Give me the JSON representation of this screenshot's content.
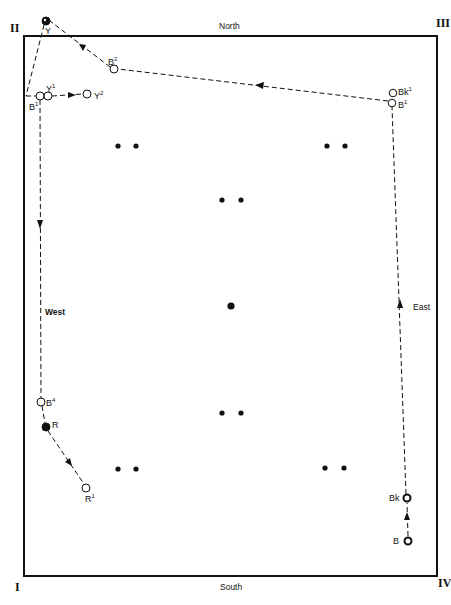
{
  "diagram": {
    "directions": {
      "north": "North",
      "south": "South",
      "west": "West",
      "east": "East"
    },
    "corners": {
      "top_left": "II",
      "top_right": "III",
      "bottom_left": "I",
      "bottom_right": "IV"
    },
    "colors": {
      "ink": "#111111",
      "background": "#ffffff",
      "frame": "#111111"
    },
    "frame": {
      "x": 24,
      "y": 36,
      "width": 413,
      "height": 540
    },
    "fixed_dots": [
      {
        "x": 118,
        "y": 146
      },
      {
        "x": 136,
        "y": 146
      },
      {
        "x": 327,
        "y": 146
      },
      {
        "x": 345,
        "y": 146
      },
      {
        "x": 222,
        "y": 200
      },
      {
        "x": 241,
        "y": 200
      },
      {
        "x": 231,
        "y": 306,
        "large": true
      },
      {
        "x": 222,
        "y": 413
      },
      {
        "x": 241,
        "y": 413
      },
      {
        "x": 118,
        "y": 469
      },
      {
        "x": 136,
        "y": 469
      },
      {
        "x": 325,
        "y": 468
      },
      {
        "x": 344,
        "y": 468
      }
    ],
    "markers": [
      {
        "id": "Y",
        "label": "Y",
        "sup": "",
        "x": 46,
        "y": 21,
        "type": "filled"
      },
      {
        "id": "B2",
        "label": "B",
        "sup": "2",
        "x": 114,
        "y": 69,
        "type": "open"
      },
      {
        "id": "Bk1",
        "label": "Bk",
        "sup": "1",
        "x": 393,
        "y": 93,
        "type": "open"
      },
      {
        "id": "B1e",
        "label": "B",
        "sup": "1",
        "x": 392,
        "y": 103,
        "type": "open"
      },
      {
        "id": "B1w",
        "label": "B",
        "sup": "1",
        "x": 40,
        "y": 96,
        "type": "open"
      },
      {
        "id": "Y1",
        "label": "Y",
        "sup": "1",
        "x": 48,
        "y": 96,
        "type": "open"
      },
      {
        "id": "Y2",
        "label": "Y",
        "sup": "2",
        "x": 87,
        "y": 94,
        "type": "open"
      },
      {
        "id": "B4",
        "label": "B",
        "sup": "4",
        "x": 41,
        "y": 402,
        "type": "open"
      },
      {
        "id": "R",
        "label": "R",
        "sup": "",
        "x": 46,
        "y": 427,
        "type": "filled"
      },
      {
        "id": "R1",
        "label": "R",
        "sup": "1",
        "x": 86,
        "y": 488,
        "type": "open"
      },
      {
        "id": "Bk",
        "label": "Bk",
        "sup": "",
        "x": 407,
        "y": 498,
        "type": "bold-open"
      },
      {
        "id": "B",
        "label": "B",
        "sup": "",
        "x": 408,
        "y": 541,
        "type": "bold-open"
      }
    ],
    "paths": [
      {
        "name": "east-path",
        "from": "B",
        "to": "B1e",
        "arrow": "up"
      },
      {
        "name": "north-path",
        "from": "B1e",
        "to": "Y",
        "arrow": "left"
      },
      {
        "name": "nw-path",
        "from": "Y",
        "to": "B1w",
        "arrow": "none"
      },
      {
        "name": "y1-y2-path",
        "from": "Y1",
        "to": "Y2",
        "arrow": "right"
      },
      {
        "name": "west-path",
        "from": "B1w",
        "to": "B4",
        "arrow": "down"
      },
      {
        "name": "sw-path",
        "from": "R",
        "to": "R1",
        "arrow": "down-right"
      }
    ]
  }
}
